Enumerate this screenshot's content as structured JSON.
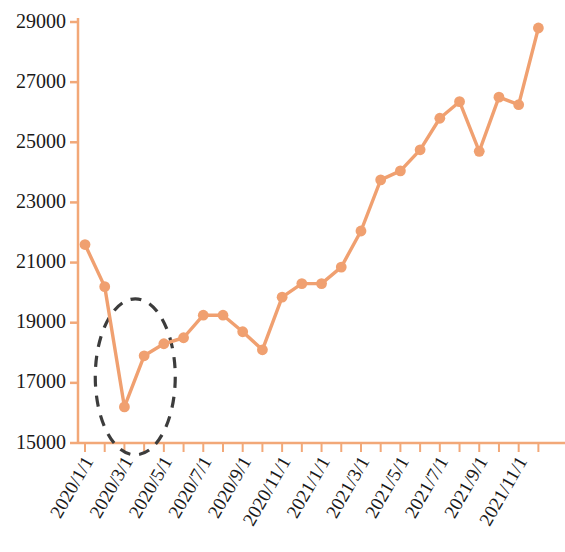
{
  "chart_data": {
    "type": "line",
    "title": "",
    "subtitle": "",
    "xlabel": "",
    "ylabel": "",
    "grid": false,
    "legend": "none",
    "line_color": "#F0A070",
    "marker_color": "#F0A070",
    "axis_color": "#F2A878",
    "annotation_color": "#3C3C3C",
    "ylim": [
      15000,
      29000
    ],
    "ytick_labels": [
      "15000",
      "17000",
      "19000",
      "21000",
      "23000",
      "25000",
      "27000",
      "29000"
    ],
    "ytick_values": [
      15000,
      17000,
      19000,
      21000,
      23000,
      25000,
      27000,
      29000
    ],
    "xtick_labels": [
      "2020/1/1",
      "2020/3/1",
      "2020/5/1",
      "2020/7/1",
      "2020/9/1",
      "2020/11/1",
      "2021/1/1",
      "2021/3/1",
      "2021/5/1",
      "2021/7/1",
      "2021/9/1",
      "2021/11/1"
    ],
    "xtick_indices": [
      0,
      2,
      4,
      6,
      8,
      10,
      12,
      14,
      16,
      18,
      20,
      22
    ],
    "x": [
      "2020/1/1",
      "2020/2/1",
      "2020/3/1",
      "2020/4/1",
      "2020/5/1",
      "2020/6/1",
      "2020/7/1",
      "2020/8/1",
      "2020/9/1",
      "2020/10/1",
      "2020/11/1",
      "2020/12/1",
      "2021/1/1",
      "2021/2/1",
      "2021/3/1",
      "2021/4/1",
      "2021/5/1",
      "2021/6/1",
      "2021/7/1",
      "2021/8/1",
      "2021/9/1",
      "2021/10/1",
      "2021/11/1",
      "2021/12/1"
    ],
    "values": [
      21600,
      20200,
      16200,
      17900,
      18300,
      18500,
      19250,
      19250,
      18700,
      18100,
      19850,
      20300,
      20300,
      20850,
      22050,
      23750,
      24050,
      24750,
      25800,
      26350,
      24700,
      26500,
      26250,
      28800
    ],
    "annotations": [
      {
        "type": "ellipse",
        "name": "covid-dip-highlight",
        "style": "dashed",
        "color": "#3C3C3C",
        "center_x_label": "2020/3/1",
        "center_y_value": 17200,
        "covers_points": [
          "2020/2/1",
          "2020/3/1",
          "2020/4/1",
          "2020/5/1"
        ]
      }
    ]
  }
}
